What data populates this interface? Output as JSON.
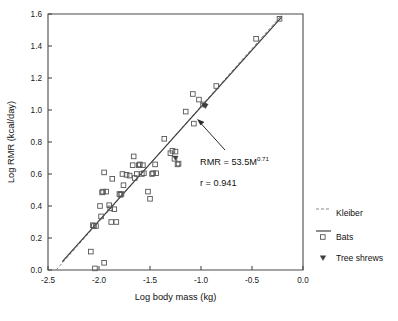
{
  "chart_data": {
    "type": "scatter",
    "title": "",
    "xlabel": "Log body mass (kg)",
    "ylabel": "Log RMR (kcal/day)",
    "xlim": [
      -2.5,
      0.0
    ],
    "ylim": [
      0.0,
      1.6
    ],
    "xticks": [
      "-2.5",
      "-2.0",
      "-1.5",
      "-1.0",
      "-0.5",
      "0.0"
    ],
    "xtick_values": [
      -2.5,
      -2.0,
      -1.5,
      -1.0,
      -0.5,
      0.0
    ],
    "yticks": [
      "0.0",
      "0.2",
      "0.4",
      "0.6",
      "0.8",
      "1.0",
      "1.2",
      "1.4",
      "1.6"
    ],
    "ytick_values": [
      0.0,
      0.2,
      0.4,
      0.6,
      0.8,
      1.0,
      1.2,
      1.4,
      1.6
    ],
    "grid": false,
    "legend_position": "right",
    "annotations": {
      "equation": "RMR = 53.5M",
      "equation_exponent": "0.71",
      "correlation": "r = 0.941"
    },
    "series": [
      {
        "name": "Kleiber",
        "type": "line",
        "style": "dashed",
        "color": "#8a8a8a",
        "x": [
          -2.42,
          -0.2
        ],
        "y": [
          0.0,
          1.6
        ]
      },
      {
        "name": "Bats fit",
        "type": "line",
        "style": "solid",
        "color": "#3a3a3a",
        "equation": "RMR = 53.5M^0.71",
        "slope": 0.71,
        "intercept": 1.728,
        "r": 0.941,
        "x": [
          -2.36,
          -0.21
        ],
        "y": [
          0.053,
          1.58
        ]
      },
      {
        "name": "Bats",
        "type": "scatter",
        "marker": "open-square",
        "color": "#555555",
        "points": [
          [
            -2.06,
            0.28
          ],
          [
            -2.05,
            0.275
          ],
          [
            -2.04,
            0.01
          ],
          [
            -2.03,
            0.275
          ],
          [
            -1.99,
            0.4
          ],
          [
            -1.98,
            0.335
          ],
          [
            -1.97,
            0.485
          ],
          [
            -1.96,
            0.49
          ],
          [
            -1.95,
            0.61
          ],
          [
            -1.95,
            0.045
          ],
          [
            -1.93,
            0.49
          ],
          [
            -1.9,
            0.405
          ],
          [
            -1.89,
            0.385
          ],
          [
            -1.88,
            0.3
          ],
          [
            -1.87,
            0.57
          ],
          [
            -1.85,
            0.38
          ],
          [
            -1.83,
            0.3
          ],
          [
            -1.8,
            0.475
          ],
          [
            -1.79,
            0.47
          ],
          [
            -1.78,
            0.475
          ],
          [
            -1.77,
            0.6
          ],
          [
            -1.76,
            0.53
          ],
          [
            -1.73,
            0.595
          ],
          [
            -1.7,
            0.59
          ],
          [
            -1.67,
            0.655
          ],
          [
            -1.66,
            0.71
          ],
          [
            -1.65,
            0.575
          ],
          [
            -1.63,
            0.6
          ],
          [
            -1.61,
            0.655
          ],
          [
            -1.6,
            0.66
          ],
          [
            -1.58,
            0.6
          ],
          [
            -1.57,
            0.655
          ],
          [
            -1.56,
            0.605
          ],
          [
            -1.52,
            0.49
          ],
          [
            -1.5,
            0.445
          ],
          [
            -1.48,
            0.6
          ],
          [
            -1.47,
            0.605
          ],
          [
            -1.45,
            0.66
          ],
          [
            -1.44,
            0.605
          ],
          [
            -1.36,
            0.82
          ],
          [
            -1.3,
            0.73
          ],
          [
            -1.28,
            0.745
          ],
          [
            -1.26,
            0.695
          ],
          [
            -1.25,
            0.74
          ],
          [
            -1.23,
            0.66
          ],
          [
            -1.22,
            0.665
          ],
          [
            -1.15,
            0.99
          ],
          [
            -1.08,
            1.1
          ],
          [
            -1.07,
            0.915
          ],
          [
            -1.02,
            1.065
          ],
          [
            -0.98,
            1.035
          ],
          [
            -0.85,
            1.15
          ],
          [
            -0.46,
            1.445
          ],
          [
            -0.23,
            1.57
          ],
          [
            -2.08,
            0.115
          ]
        ]
      },
      {
        "name": "Tree shrews",
        "type": "scatter",
        "marker": "filled-triangle-down",
        "color": "#3d3d3d",
        "points": [
          [
            -0.97,
            1.03
          ],
          [
            -0.955,
            1.025
          ],
          [
            -1.25,
            0.7
          ]
        ]
      }
    ]
  },
  "legend": {
    "items": [
      {
        "label": "Kleiber",
        "marker": "dashed-line"
      },
      {
        "label": "Bats",
        "marker": "solid-line-open-square"
      },
      {
        "label": "Tree shrews",
        "marker": "filled-triangle"
      }
    ]
  }
}
